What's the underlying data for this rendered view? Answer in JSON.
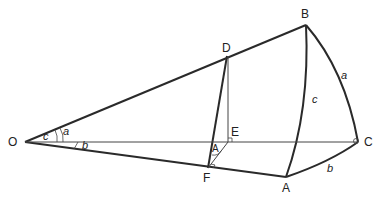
{
  "diagram": {
    "type": "spherical-triangle-construction",
    "points": {
      "O": {
        "label": "O",
        "x": 25,
        "y": 142
      },
      "B": {
        "label": "B",
        "x": 306,
        "y": 25
      },
      "C": {
        "label": "C",
        "x": 358,
        "y": 142
      },
      "A": {
        "label": "A",
        "x": 286,
        "y": 177
      },
      "D": {
        "label": "D",
        "x": 227,
        "y": 56
      },
      "E": {
        "label": "E",
        "x": 228,
        "y": 142
      },
      "F": {
        "label": "F",
        "x": 208,
        "y": 168
      }
    },
    "arc_labels": {
      "a": "a",
      "b": "b",
      "c": "c"
    },
    "angle_labels": {
      "c": "c",
      "a": "a",
      "b": "b",
      "A": "A"
    },
    "colors": {
      "stroke": "#2a2a2a",
      "thin": "#444444"
    }
  }
}
